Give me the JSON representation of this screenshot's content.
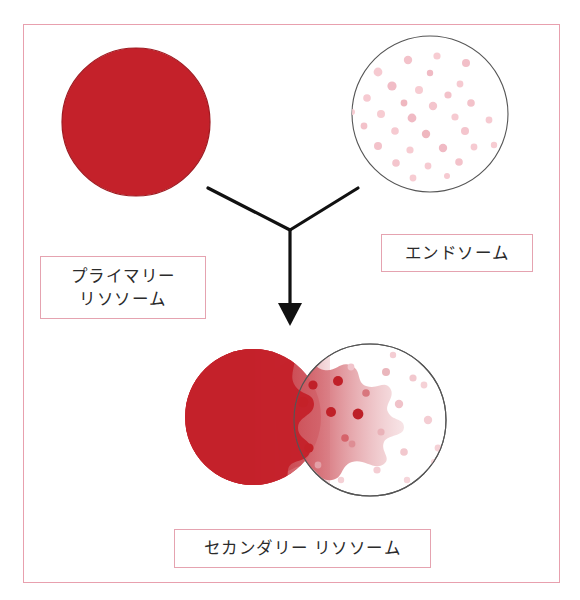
{
  "figure": {
    "background_color": "#ffffff",
    "frame": {
      "name": "outer-frame",
      "border_color": "#e8a0ae",
      "x": 23,
      "y": 24,
      "width": 537,
      "height": 559
    }
  },
  "colors": {
    "lysosome_red": "#c4212a",
    "lysosome_red_dark": "#ab1a22",
    "endosome_outline": "#555555",
    "endosome_dot_pale": "#f7ccd2",
    "endosome_dot_mid": "#efb7bf",
    "diffusion_dot_dark": "#c02028",
    "frame_pink": "#e8a0ae",
    "label_border": "#e5a3b0",
    "label_text": "#2b2b2b",
    "arrow_black": "#111111"
  },
  "labels": {
    "primary_lysosome": "プライマリー\nリソソーム",
    "endosome": "エンドソーム",
    "secondary_lysosome": "セカンダリー リソソーム"
  },
  "shapes": {
    "primary_lysosome_circle": {
      "name": "primary-lysosome-circle",
      "cx": 136,
      "cy": 122,
      "r": 74,
      "fill": "#c4212a",
      "description": "solid red filled circle"
    },
    "endosome_circle": {
      "name": "endosome-circle",
      "cx": 430,
      "cy": 114,
      "r": 78,
      "fill": "#ffffff",
      "stroke": "#555555",
      "description": "outlined circle with scattered pale pink dots"
    },
    "secondary_lysosome": {
      "name": "secondary-lysosome-fusion",
      "lysosome": {
        "cx": 253,
        "cy": 417,
        "r": 68
      },
      "endosome": {
        "cx": 370,
        "cy": 420,
        "r": 76
      },
      "description": "red lysosome fused with endosome, red contents diffusing across an irregular boundary"
    },
    "arrow": {
      "name": "fusion-arrow",
      "left_branch": [
        [
          208,
          188
        ],
        [
          290,
          230
        ]
      ],
      "right_branch": [
        [
          358,
          188
        ],
        [
          290,
          230
        ]
      ],
      "stem": [
        [
          290,
          230
        ],
        [
          290,
          308
        ]
      ],
      "head_tip": [
        290,
        325
      ],
      "color": "#111111"
    }
  },
  "endosome_dots": [
    {
      "x": 408,
      "y": 60,
      "r": 4.2,
      "c": "#f3c2ca"
    },
    {
      "x": 437,
      "y": 56,
      "r": 3.6,
      "c": "#f7ccd2"
    },
    {
      "x": 466,
      "y": 63,
      "r": 4.0,
      "c": "#f2bfc8"
    },
    {
      "x": 378,
      "y": 72,
      "r": 4.4,
      "c": "#f6cad1"
    },
    {
      "x": 430,
      "y": 73,
      "r": 3.2,
      "c": "#f0bac4"
    },
    {
      "x": 460,
      "y": 84,
      "r": 3.4,
      "c": "#f6cad1"
    },
    {
      "x": 392,
      "y": 86,
      "r": 4.6,
      "c": "#f1bcc6"
    },
    {
      "x": 419,
      "y": 90,
      "r": 4.0,
      "c": "#f7ccd2"
    },
    {
      "x": 448,
      "y": 95,
      "r": 3.6,
      "c": "#f3c2ca"
    },
    {
      "x": 367,
      "y": 98,
      "r": 3.8,
      "c": "#f6cad1"
    },
    {
      "x": 404,
      "y": 103,
      "r": 3.4,
      "c": "#efb7bf"
    },
    {
      "x": 433,
      "y": 106,
      "r": 4.2,
      "c": "#f4c5cd"
    },
    {
      "x": 471,
      "y": 103,
      "r": 3.8,
      "c": "#f3c2ca"
    },
    {
      "x": 381,
      "y": 114,
      "r": 4.0,
      "c": "#f7ccd2"
    },
    {
      "x": 412,
      "y": 118,
      "r": 4.4,
      "c": "#f0bac4"
    },
    {
      "x": 455,
      "y": 117,
      "r": 3.6,
      "c": "#f6cad1"
    },
    {
      "x": 364,
      "y": 126,
      "r": 3.4,
      "c": "#f3c2ca"
    },
    {
      "x": 395,
      "y": 131,
      "r": 3.8,
      "c": "#f6cad1"
    },
    {
      "x": 426,
      "y": 134,
      "r": 4.2,
      "c": "#efb7bf"
    },
    {
      "x": 465,
      "y": 131,
      "r": 4.0,
      "c": "#f4c5cd"
    },
    {
      "x": 489,
      "y": 120,
      "r": 3.4,
      "c": "#f6cad1"
    },
    {
      "x": 378,
      "y": 146,
      "r": 4.0,
      "c": "#f3c2ca"
    },
    {
      "x": 410,
      "y": 150,
      "r": 3.6,
      "c": "#f7ccd2"
    },
    {
      "x": 443,
      "y": 148,
      "r": 4.2,
      "c": "#f0bac4"
    },
    {
      "x": 474,
      "y": 147,
      "r": 3.4,
      "c": "#f6cad1"
    },
    {
      "x": 396,
      "y": 163,
      "r": 3.8,
      "c": "#f4c5cd"
    },
    {
      "x": 428,
      "y": 166,
      "r": 3.4,
      "c": "#f6cad1"
    },
    {
      "x": 459,
      "y": 162,
      "r": 3.8,
      "c": "#f3c2ca"
    },
    {
      "x": 413,
      "y": 178,
      "r": 3.4,
      "c": "#f7ccd2"
    },
    {
      "x": 447,
      "y": 176,
      "r": 3.0,
      "c": "#f6cad1"
    },
    {
      "x": 352,
      "y": 112,
      "r": 3.0,
      "c": "#f7ccd2"
    },
    {
      "x": 494,
      "y": 145,
      "r": 3.2,
      "c": "#f7ccd2"
    }
  ],
  "secondary_dots": [
    {
      "x": 313,
      "y": 385,
      "r": 4.6,
      "c": "#c02028"
    },
    {
      "x": 338,
      "y": 381,
      "r": 5.0,
      "c": "#c02028"
    },
    {
      "x": 303,
      "y": 402,
      "r": 5.2,
      "c": "#c42128"
    },
    {
      "x": 331,
      "y": 412,
      "r": 5.0,
      "c": "#c02028"
    },
    {
      "x": 358,
      "y": 414,
      "r": 5.4,
      "c": "#bd1f27"
    },
    {
      "x": 309,
      "y": 448,
      "r": 4.6,
      "c": "#c42128"
    },
    {
      "x": 345,
      "y": 438,
      "r": 3.8,
      "c": "#d6636a"
    },
    {
      "x": 290,
      "y": 428,
      "r": 3.4,
      "c": "#cf4c55"
    },
    {
      "x": 366,
      "y": 393,
      "r": 3.8,
      "c": "#d8767d"
    },
    {
      "x": 352,
      "y": 444,
      "r": 3.4,
      "c": "#de8d94"
    },
    {
      "x": 318,
      "y": 465,
      "r": 3.4,
      "c": "#e3a0a7"
    },
    {
      "x": 386,
      "y": 372,
      "r": 4.0,
      "c": "#eab6bc"
    },
    {
      "x": 381,
      "y": 432,
      "r": 3.6,
      "c": "#e9b2b8"
    },
    {
      "x": 399,
      "y": 404,
      "r": 4.2,
      "c": "#f0c2c9"
    },
    {
      "x": 413,
      "y": 378,
      "r": 3.6,
      "c": "#f2c8ce"
    },
    {
      "x": 404,
      "y": 452,
      "r": 3.8,
      "c": "#f2c8ce"
    },
    {
      "x": 428,
      "y": 420,
      "r": 4.2,
      "c": "#f4cdd3"
    },
    {
      "x": 424,
      "y": 385,
      "r": 3.4,
      "c": "#f5d1d6"
    },
    {
      "x": 438,
      "y": 448,
      "r": 3.4,
      "c": "#f5d1d6"
    },
    {
      "x": 351,
      "y": 367,
      "r": 3.4,
      "c": "#f1c4cb"
    },
    {
      "x": 377,
      "y": 470,
      "r": 3.6,
      "c": "#f4cdd3"
    },
    {
      "x": 407,
      "y": 480,
      "r": 3.2,
      "c": "#f6d5da"
    },
    {
      "x": 341,
      "y": 480,
      "r": 3.2,
      "c": "#f5d1d6"
    },
    {
      "x": 393,
      "y": 355,
      "r": 3.2,
      "c": "#f4cdd3"
    },
    {
      "x": 434,
      "y": 462,
      "r": 3.0,
      "c": "#f6d5da"
    }
  ]
}
